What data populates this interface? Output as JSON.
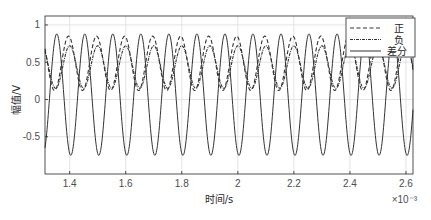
{
  "chart_data": {
    "type": "line",
    "title": "",
    "xlabel": "时间/s",
    "ylabel": "幅值/V",
    "x_exponent_label": "×10⁻³",
    "xlim": [
      1.312,
      2.625
    ],
    "ylim": [
      -1.0,
      1.12
    ],
    "x_ticks": [
      1.4,
      1.6,
      1.8,
      2.0,
      2.2,
      2.4,
      2.6
    ],
    "x_tick_labels": [
      "1.4",
      "1.6",
      "1.8",
      "2",
      "2.2",
      "2.4",
      "2.6"
    ],
    "y_ticks": [
      -0.5,
      0,
      0.5,
      1
    ],
    "y_tick_labels": [
      "-0.5",
      "0",
      "0.5",
      "1"
    ],
    "grid": true,
    "legend_position": "top-right",
    "x_units_note": "time in ms (×10^-3 s)",
    "series": [
      {
        "name": "正",
        "style": "dashed",
        "color": "#333333",
        "model": {
          "offset": 0.485,
          "amplitude": 0.365,
          "frequency_per_ms": 10,
          "peak_at_ms": 1.396
        }
      },
      {
        "name": "负",
        "style": "dashdot",
        "color": "#333333",
        "model": {
          "offset": 0.435,
          "amplitude": 0.285,
          "frequency_per_ms": 10,
          "peak_at_ms": 1.4
        }
      },
      {
        "name": "差分",
        "style": "solid",
        "color": "#333333",
        "model": {
          "offset": 0.065,
          "amplitude": 0.815,
          "frequency_per_ms": 10,
          "peak_at_ms": 1.354
        }
      }
    ]
  }
}
